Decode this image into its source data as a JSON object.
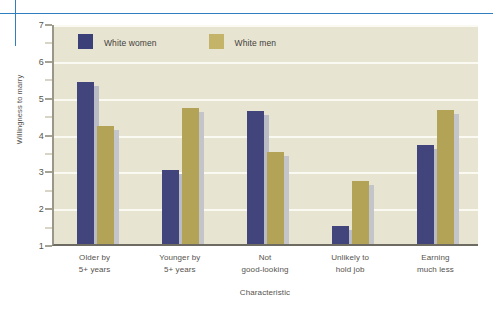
{
  "decorations": {
    "rule_color": "#2f7ec0"
  },
  "legend": {
    "position": "top-left-inside",
    "items": [
      {
        "label": "White women",
        "color": "#41457c"
      },
      {
        "label": "White men",
        "color": "#b2a356"
      }
    ]
  },
  "chart_data": {
    "type": "bar",
    "title": "",
    "xlabel": "Characteristic",
    "ylabel": "Willingness to marry",
    "ylim": [
      1,
      7
    ],
    "yticks": [
      1,
      2,
      3,
      4,
      5,
      6,
      7
    ],
    "ytick_labels": [
      "1",
      "2",
      "3",
      "4",
      "5",
      "6",
      "7"
    ],
    "grid": true,
    "grid_axis": "y",
    "categories": [
      "Older by\n5+ years",
      "Younger by\n5+ years",
      "Not\ngood-looking",
      "Unlikely to\nhold job",
      "Earning\nmuch less"
    ],
    "category_lines": [
      [
        "Older by",
        "5+ years"
      ],
      [
        "Younger by",
        "5+ years"
      ],
      [
        "Not",
        "good-looking"
      ],
      [
        "Unlikely to",
        "hold job"
      ],
      [
        "Earning",
        "much less"
      ]
    ],
    "series": [
      {
        "name": "White women",
        "color": "#41457c",
        "values": [
          5.4,
          3.0,
          4.6,
          1.5,
          3.7
        ]
      },
      {
        "name": "White men",
        "color": "#b2a356",
        "values": [
          4.2,
          4.7,
          3.5,
          2.7,
          4.65
        ]
      }
    ],
    "legend_position": "upper left",
    "plot_background": "#e8e4d2"
  }
}
